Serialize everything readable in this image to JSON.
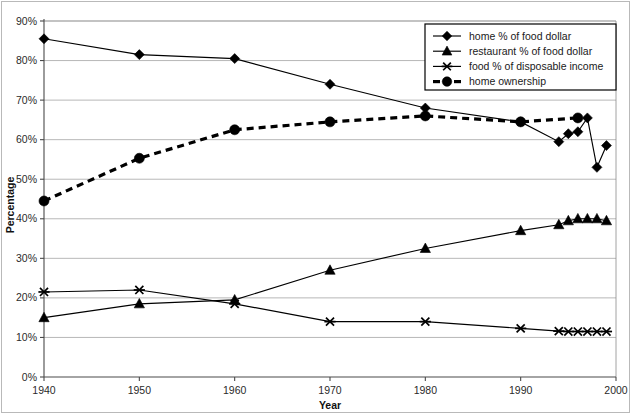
{
  "chart_data": {
    "type": "line",
    "title": "",
    "xlabel": "Year",
    "ylabel": "Percentage",
    "xlim": [
      1940,
      2000
    ],
    "ylim": [
      0,
      90
    ],
    "xticks": [
      "1940",
      "1950",
      "1960",
      "1970",
      "1980",
      "1990",
      "2000"
    ],
    "yticks": [
      "0%",
      "10%",
      "20%",
      "30%",
      "40%",
      "50%",
      "60%",
      "70%",
      "80%",
      "90%"
    ],
    "grid": "horizontal",
    "legend_position": "top-right",
    "series": [
      {
        "name": "home % of food dollar",
        "marker": "diamond",
        "linestyle": "solid",
        "color": "#000000",
        "x": [
          1940,
          1950,
          1960,
          1970,
          1980,
          1990,
          1994,
          1995,
          1996,
          1997,
          1998,
          1999
        ],
        "values": [
          85.5,
          81.5,
          80.5,
          74.0,
          68.0,
          64.5,
          59.5,
          61.5,
          62.0,
          65.5,
          53.0,
          58.5
        ]
      },
      {
        "name": "restaurant % of food dollar",
        "marker": "triangle",
        "linestyle": "solid",
        "color": "#000000",
        "x": [
          1940,
          1950,
          1960,
          1970,
          1980,
          1990,
          1994,
          1995,
          1996,
          1997,
          1998,
          1999
        ],
        "values": [
          15.0,
          18.5,
          19.5,
          27.0,
          32.5,
          37.0,
          38.5,
          39.5,
          40.0,
          40.0,
          40.0,
          39.5
        ]
      },
      {
        "name": "food % of disposable income",
        "marker": "star",
        "linestyle": "solid",
        "color": "#000000",
        "x": [
          1940,
          1950,
          1960,
          1970,
          1980,
          1990,
          1994,
          1995,
          1996,
          1997,
          1998,
          1999
        ],
        "values": [
          21.5,
          22.0,
          18.5,
          14.0,
          14.0,
          12.3,
          11.6,
          11.5,
          11.5,
          11.5,
          11.5,
          11.5
        ]
      },
      {
        "name": "home ownership",
        "marker": "circle",
        "linestyle": "dashed",
        "color": "#000000",
        "x": [
          1940,
          1950,
          1960,
          1970,
          1980,
          1990,
          1996
        ],
        "values": [
          44.5,
          55.3,
          62.5,
          64.5,
          66.0,
          64.5,
          65.5
        ]
      }
    ]
  },
  "legend": {
    "entries": [
      {
        "label": "home % of food dollar",
        "marker": "diamond",
        "style": "solid"
      },
      {
        "label": "restaurant % of food dollar",
        "marker": "triangle",
        "style": "solid"
      },
      {
        "label": "food % of disposable income",
        "marker": "star",
        "style": "solid"
      },
      {
        "label": "home ownership",
        "marker": "circle",
        "style": "dashed"
      }
    ]
  }
}
